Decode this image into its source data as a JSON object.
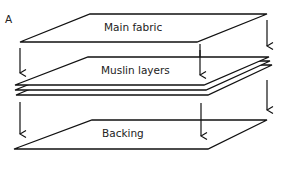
{
  "figure": {
    "panel_label": "A",
    "layers": [
      {
        "name": "main-fabric",
        "label": "Main fabric"
      },
      {
        "name": "muslin-layers",
        "label": "Muslin layers"
      },
      {
        "name": "backing",
        "label": "Backing"
      }
    ]
  },
  "colors": {
    "stroke": "#111111",
    "background": "#ffffff"
  }
}
